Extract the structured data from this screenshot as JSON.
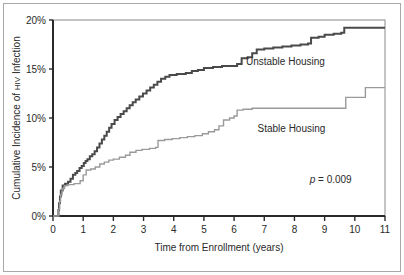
{
  "chart_data": {
    "type": "line",
    "title": "",
    "xlabel": "Time from Enrollment (years)",
    "ylabel": "Cumulative Incidence of HIV Infection",
    "ylabel_parts": {
      "lead": "Cumulative Incidence of ",
      "smallcaps": "HIV",
      "tail": " Infection"
    },
    "xlim": [
      0,
      11
    ],
    "ylim": [
      0,
      20
    ],
    "xticks": [
      0,
      1,
      2,
      3,
      4,
      5,
      6,
      7,
      8,
      9,
      10,
      11
    ],
    "xtick_labels": [
      "0",
      "1",
      "2",
      "3",
      "4",
      "5",
      "6",
      "7",
      "8",
      "9",
      "10",
      "11"
    ],
    "yticks": [
      0,
      5,
      10,
      15,
      20
    ],
    "ytick_labels": [
      "0%",
      "5%",
      "10%",
      "15%",
      "20%"
    ],
    "grid": false,
    "legend_position": "inline-annotations",
    "step_type": "post",
    "annotations": [
      {
        "name": "p-value",
        "text": "p = 0.009",
        "italic_prefix": "p",
        "rest": " = 0.009",
        "x": 9.2,
        "y": 3.4
      },
      {
        "name": "unstable-housing-label",
        "text": "Unstable Housing",
        "x": 7.7,
        "y": 15.4
      },
      {
        "name": "stable-housing-label",
        "text": "Stable Housing",
        "x": 7.9,
        "y": 8.6
      }
    ],
    "series": [
      {
        "name": "Unstable Housing",
        "color": "#4a4a4a",
        "line_width": 2.0,
        "final_value": 19.2,
        "points": [
          [
            0.0,
            0.0
          ],
          [
            0.16,
            0.0
          ],
          [
            0.18,
            0.6
          ],
          [
            0.2,
            1.3
          ],
          [
            0.23,
            2.0
          ],
          [
            0.26,
            2.6
          ],
          [
            0.32,
            3.1
          ],
          [
            0.4,
            3.3
          ],
          [
            0.5,
            3.5
          ],
          [
            0.58,
            3.8
          ],
          [
            0.66,
            4.2
          ],
          [
            0.74,
            4.4
          ],
          [
            0.8,
            4.6
          ],
          [
            0.88,
            4.9
          ],
          [
            0.95,
            5.1
          ],
          [
            1.02,
            5.4
          ],
          [
            1.08,
            5.6
          ],
          [
            1.14,
            5.8
          ],
          [
            1.22,
            6.1
          ],
          [
            1.3,
            6.3
          ],
          [
            1.38,
            6.6
          ],
          [
            1.46,
            7.0
          ],
          [
            1.54,
            7.4
          ],
          [
            1.62,
            7.8
          ],
          [
            1.7,
            8.2
          ],
          [
            1.78,
            8.6
          ],
          [
            1.86,
            9.0
          ],
          [
            1.94,
            9.4
          ],
          [
            2.04,
            9.8
          ],
          [
            2.14,
            10.1
          ],
          [
            2.24,
            10.4
          ],
          [
            2.34,
            10.7
          ],
          [
            2.44,
            11.0
          ],
          [
            2.54,
            11.3
          ],
          [
            2.64,
            11.6
          ],
          [
            2.74,
            11.9
          ],
          [
            2.86,
            12.2
          ],
          [
            2.98,
            12.5
          ],
          [
            3.1,
            12.8
          ],
          [
            3.22,
            13.1
          ],
          [
            3.34,
            13.4
          ],
          [
            3.46,
            13.7
          ],
          [
            3.58,
            14.0
          ],
          [
            3.72,
            14.2
          ],
          [
            3.86,
            14.4
          ],
          [
            4.1,
            14.5
          ],
          [
            4.4,
            14.6
          ],
          [
            4.6,
            14.8
          ],
          [
            4.8,
            14.9
          ],
          [
            5.0,
            15.1
          ],
          [
            5.3,
            15.2
          ],
          [
            5.6,
            15.3
          ],
          [
            5.9,
            15.3
          ],
          [
            6.1,
            15.5
          ],
          [
            6.25,
            16.1
          ],
          [
            6.45,
            16.2
          ],
          [
            6.6,
            16.6
          ],
          [
            6.75,
            17.0
          ],
          [
            7.0,
            17.1
          ],
          [
            7.3,
            17.2
          ],
          [
            7.6,
            17.3
          ],
          [
            7.9,
            17.4
          ],
          [
            8.2,
            17.5
          ],
          [
            8.45,
            17.6
          ],
          [
            8.55,
            18.2
          ],
          [
            8.8,
            18.3
          ],
          [
            9.0,
            18.5
          ],
          [
            9.3,
            18.6
          ],
          [
            9.55,
            18.7
          ],
          [
            9.65,
            19.2
          ],
          [
            10.2,
            19.2
          ],
          [
            11.0,
            19.2
          ]
        ]
      },
      {
        "name": "Stable Housing",
        "color": "#9a9a9a",
        "line_width": 1.4,
        "final_value": 13.1,
        "points": [
          [
            0.0,
            0.0
          ],
          [
            0.17,
            0.0
          ],
          [
            0.19,
            0.7
          ],
          [
            0.22,
            1.5
          ],
          [
            0.25,
            2.2
          ],
          [
            0.3,
            2.8
          ],
          [
            0.38,
            3.1
          ],
          [
            0.5,
            3.2
          ],
          [
            0.7,
            3.3
          ],
          [
            0.9,
            3.6
          ],
          [
            1.0,
            4.2
          ],
          [
            1.1,
            4.7
          ],
          [
            1.25,
            4.8
          ],
          [
            1.4,
            5.0
          ],
          [
            1.55,
            5.3
          ],
          [
            1.7,
            5.5
          ],
          [
            1.85,
            5.7
          ],
          [
            2.0,
            5.8
          ],
          [
            2.2,
            6.0
          ],
          [
            2.4,
            6.2
          ],
          [
            2.55,
            6.5
          ],
          [
            2.75,
            6.7
          ],
          [
            2.95,
            6.8
          ],
          [
            3.2,
            6.9
          ],
          [
            3.4,
            7.0
          ],
          [
            3.48,
            7.7
          ],
          [
            3.7,
            7.8
          ],
          [
            3.95,
            7.9
          ],
          [
            4.2,
            8.0
          ],
          [
            4.45,
            8.1
          ],
          [
            4.7,
            8.2
          ],
          [
            4.95,
            8.4
          ],
          [
            5.15,
            8.6
          ],
          [
            5.35,
            8.8
          ],
          [
            5.5,
            9.2
          ],
          [
            5.65,
            9.8
          ],
          [
            5.85,
            10.0
          ],
          [
            6.0,
            10.2
          ],
          [
            6.1,
            10.8
          ],
          [
            6.3,
            10.9
          ],
          [
            6.6,
            11.0
          ],
          [
            7.0,
            11.0
          ],
          [
            7.5,
            11.0
          ],
          [
            8.0,
            11.0
          ],
          [
            8.5,
            11.0
          ],
          [
            9.0,
            11.0
          ],
          [
            9.6,
            11.0
          ],
          [
            9.7,
            12.1
          ],
          [
            10.25,
            12.1
          ],
          [
            10.35,
            13.1
          ],
          [
            11.0,
            13.1
          ]
        ]
      }
    ]
  },
  "plot_geometry": {
    "left": 53,
    "right": 385,
    "top": 20,
    "bottom": 216
  }
}
